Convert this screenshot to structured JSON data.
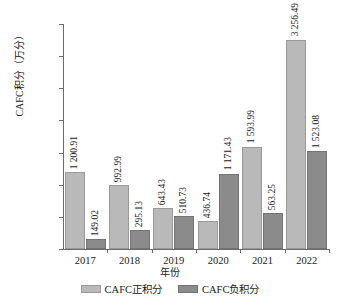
{
  "chart_data": {
    "type": "bar",
    "title": "",
    "xlabel": "年份",
    "ylabel": "CAFC积分（万分）",
    "categories": [
      "2017",
      "2018",
      "2019",
      "2020",
      "2021",
      "2022"
    ],
    "ylim": [
      0,
      3500
    ],
    "yticks": [
      0,
      500,
      1000,
      1500,
      2000,
      2500,
      3000,
      3500
    ],
    "ytick_labels": [
      "0",
      "500",
      "1 000",
      "1 500",
      "2 000",
      "2 500",
      "3 000",
      "3 500"
    ],
    "grid": false,
    "legend_position": "bottom",
    "series": [
      {
        "name": "CAFC正积分",
        "color": "#b9b9b9",
        "values": [
          1200.91,
          992.99,
          643.43,
          436.74,
          1593.99,
          3256.49
        ],
        "labels": [
          "1 200.91",
          "992.99",
          "643.43",
          "436.74",
          "1 593.99",
          "3 256.49"
        ]
      },
      {
        "name": "CAFC负积分",
        "color": "#8b8b8b",
        "values": [
          149.02,
          295.13,
          510.73,
          1171.43,
          563.25,
          1523.08
        ],
        "labels": [
          "149.02",
          "295.13",
          "510.73",
          "1 171.43",
          "563.25",
          "1 523.08"
        ]
      }
    ]
  }
}
